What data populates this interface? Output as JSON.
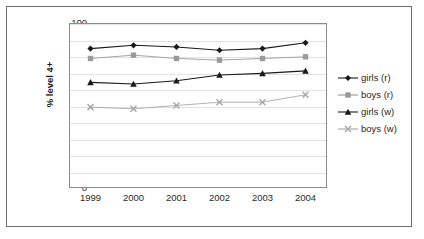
{
  "chart_data": {
    "type": "line",
    "title": "",
    "xlabel": "",
    "ylabel": "% level 4+",
    "categories": [
      "1999",
      "2000",
      "2001",
      "2002",
      "2003",
      "2004"
    ],
    "x": [
      1999,
      2000,
      2001,
      2002,
      2003,
      2004
    ],
    "ylim": [
      0,
      100
    ],
    "ytick_step": 10,
    "yticks": [
      100,
      90,
      80,
      70,
      60,
      50,
      40,
      30,
      20,
      10,
      0
    ],
    "grid": "horizontal",
    "legend_position": "right",
    "series": [
      {
        "name": "girls (r)",
        "marker": "diamond",
        "color": "#1a1a1a",
        "values": [
          84.5,
          86.5,
          85.5,
          83.5,
          84.5,
          88.0
        ]
      },
      {
        "name": "boys (r)",
        "marker": "square",
        "color": "#9a9a9a",
        "values": [
          78.5,
          80.5,
          78.5,
          77.5,
          78.5,
          79.5
        ]
      },
      {
        "name": "girls (w)",
        "marker": "triangle",
        "color": "#1a1a1a",
        "values": [
          64.0,
          63.0,
          65.0,
          68.5,
          69.5,
          71.0
        ]
      },
      {
        "name": "boys (w)",
        "marker": "cross",
        "color": "#a8a8a8",
        "values": [
          49.0,
          48.0,
          50.0,
          52.0,
          52.0,
          56.5
        ]
      }
    ]
  },
  "legend": {
    "items": [
      {
        "label": "girls (r)"
      },
      {
        "label": "boys (r)"
      },
      {
        "label": "girls (w)"
      },
      {
        "label": "boys (w)"
      }
    ]
  },
  "colors": {
    "plot_border": "#8a8a8a",
    "gridline": "#e2e2e2",
    "outer_border": "#6f6f6f",
    "background": "#ffffff"
  }
}
